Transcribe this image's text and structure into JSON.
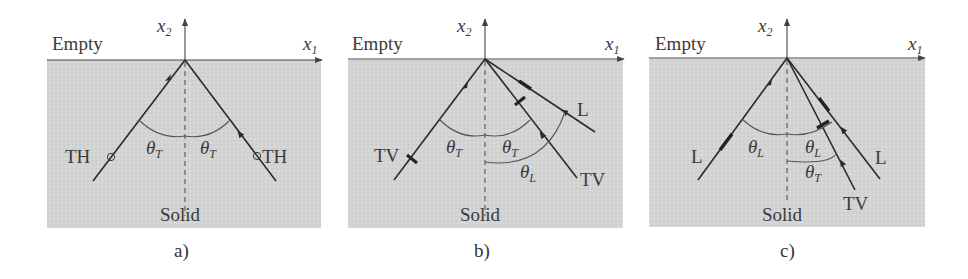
{
  "colors": {
    "solid_fill": "#d4d4d4",
    "ray": "#2a2a2a",
    "text": "#3a3a3a"
  },
  "axes": {
    "horizontal": "x",
    "horizontal_sub": "1",
    "vertical": "x",
    "vertical_sub": "2"
  },
  "regions": {
    "top": "Empty",
    "bottom": "Solid"
  },
  "panels": [
    {
      "caption": "a)",
      "incident": {
        "label": "TH",
        "polarization": "circle-marker"
      },
      "reflected": [
        {
          "label": "TH",
          "polarization": "circle-marker"
        }
      ],
      "angles": [
        {
          "symbol": "θ",
          "sub": "T"
        },
        {
          "symbol": "θ",
          "sub": "T"
        }
      ]
    },
    {
      "caption": "b)",
      "incident": {
        "label": "TV",
        "polarization": "transverse-tick"
      },
      "reflected": [
        {
          "label": "L",
          "polarization": "longitudinal-dash"
        },
        {
          "label": "TV",
          "polarization": "transverse-tick"
        }
      ],
      "angles": [
        {
          "symbol": "θ",
          "sub": "T"
        },
        {
          "symbol": "θ",
          "sub": "T"
        },
        {
          "symbol": "θ",
          "sub": "L"
        }
      ]
    },
    {
      "caption": "c)",
      "incident": {
        "label": "L",
        "polarization": "longitudinal-dash"
      },
      "reflected": [
        {
          "label": "L",
          "polarization": "longitudinal-dash"
        },
        {
          "label": "TV",
          "polarization": "transverse-tick"
        }
      ],
      "angles": [
        {
          "symbol": "θ",
          "sub": "L"
        },
        {
          "symbol": "θ",
          "sub": "L"
        },
        {
          "symbol": "θ",
          "sub": "T"
        }
      ]
    }
  ]
}
